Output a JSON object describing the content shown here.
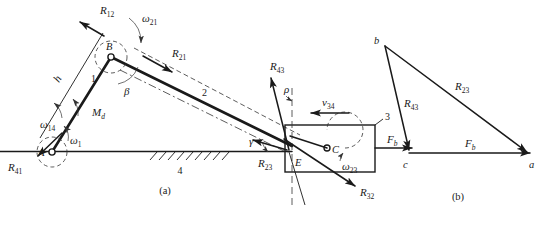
{
  "figure": {
    "title_a": "(a)",
    "title_b": "(b)"
  },
  "mechanism": {
    "joints": [
      {
        "name": "A",
        "label": "A"
      },
      {
        "name": "B",
        "label": "B"
      },
      {
        "name": "C",
        "label": "C"
      },
      {
        "name": "E",
        "label": "E"
      }
    ],
    "links": [
      {
        "name": "link-1",
        "label": "1"
      },
      {
        "name": "link-2",
        "label": "2"
      },
      {
        "name": "link-3",
        "label": "3"
      },
      {
        "name": "link-4",
        "label": "4"
      }
    ],
    "forces": [
      {
        "name": "R12",
        "base": "R",
        "sub": "12"
      },
      {
        "name": "R21",
        "base": "R",
        "sub": "21"
      },
      {
        "name": "R41",
        "base": "R",
        "sub": "41"
      },
      {
        "name": "R43",
        "base": "R",
        "sub": "43"
      },
      {
        "name": "R23",
        "base": "R",
        "sub": "23"
      },
      {
        "name": "R32",
        "base": "R",
        "sub": "32"
      },
      {
        "name": "Fb",
        "base": "F",
        "sub": "b"
      }
    ],
    "kinematics": [
      {
        "name": "omega-21",
        "base": "ω",
        "sub": "21"
      },
      {
        "name": "omega-14",
        "base": "ω",
        "sub": "14"
      },
      {
        "name": "omega-1",
        "base": "ω",
        "sub": "1"
      },
      {
        "name": "omega-23",
        "base": "ω",
        "sub": "23"
      },
      {
        "name": "v34",
        "base": "v",
        "sub": "34"
      }
    ],
    "moments": [
      {
        "name": "Md",
        "base": "M",
        "sub": "d"
      }
    ],
    "angles": [
      {
        "name": "beta",
        "label": "β"
      },
      {
        "name": "rho",
        "label": "ρ"
      },
      {
        "name": "gamma",
        "label": "γ"
      }
    ],
    "dimensions": [
      {
        "name": "h",
        "label": "h"
      }
    ]
  },
  "force_triangle": {
    "vertices": [
      {
        "name": "vertex-b",
        "label": "b"
      },
      {
        "name": "vertex-c",
        "label": "c"
      },
      {
        "name": "vertex-a",
        "label": "a"
      }
    ],
    "sides": [
      {
        "name": "R23",
        "base": "R",
        "sub": "23"
      },
      {
        "name": "R43",
        "base": "R",
        "sub": "43"
      },
      {
        "name": "Fb",
        "base": "F",
        "sub": "b"
      }
    ]
  },
  "colors": {
    "ink": "#1a1a1a",
    "hairline": "#333333",
    "background": "#ffffff"
  }
}
